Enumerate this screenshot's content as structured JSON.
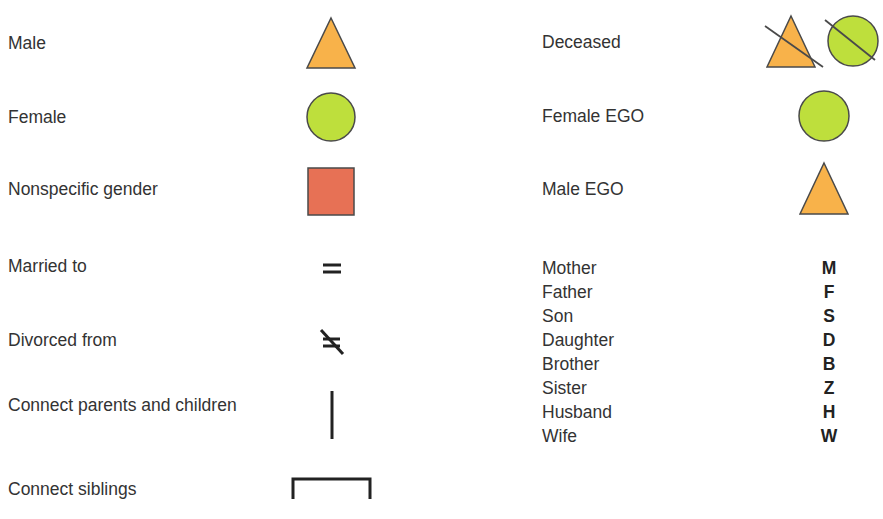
{
  "colors": {
    "male_fill": "#F8B24A",
    "female_fill": "#BEDF3C",
    "nonspecific_fill": "#E77155",
    "stroke": "#4a4a4a",
    "line": "#222222"
  },
  "left_column": [
    {
      "label": "Male",
      "symbol": "triangle-icon"
    },
    {
      "label": "Female",
      "symbol": "circle-icon"
    },
    {
      "label": "Nonspecific gender",
      "symbol": "square-icon"
    },
    {
      "label": "Married to",
      "symbol": "equals-icon"
    },
    {
      "label": "Divorced from",
      "symbol": "slashed-equals-icon"
    },
    {
      "label": "Connect parents and children",
      "symbol": "vertical-line-icon"
    },
    {
      "label": "Connect siblings",
      "symbol": "bracket-icon"
    }
  ],
  "right_column": [
    {
      "label": "Deceased",
      "symbol": "crossed-triangle-and-circle-icon"
    },
    {
      "label": "Female EGO",
      "symbol": "circle-icon"
    },
    {
      "label": "Male EGO",
      "symbol": "triangle-icon"
    }
  ],
  "kin_terms": [
    {
      "term": "Mother",
      "code": "M"
    },
    {
      "term": "Father",
      "code": "F"
    },
    {
      "term": "Son",
      "code": "S"
    },
    {
      "term": "Daughter",
      "code": "D"
    },
    {
      "term": "Brother",
      "code": "B"
    },
    {
      "term": "Sister",
      "code": "Z"
    },
    {
      "term": "Husband",
      "code": "H"
    },
    {
      "term": "Wife",
      "code": "W"
    }
  ]
}
